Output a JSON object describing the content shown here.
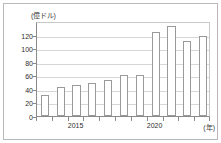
{
  "chart_data": {
    "type": "bar",
    "title": "",
    "subtitle": "",
    "unit_label": "(億ドル)",
    "xlabel": "(年)",
    "ylabel": "",
    "categories": [
      "2013",
      "2014",
      "2015",
      "2016",
      "2017",
      "2018",
      "2019",
      "2020",
      "2021",
      "2022",
      "2023"
    ],
    "values": [
      31,
      43,
      46,
      48,
      53,
      60,
      60,
      124,
      133,
      110,
      118
    ],
    "ylim": [
      0,
      140
    ],
    "yticks": [
      0,
      20,
      40,
      60,
      80,
      100,
      120
    ],
    "ytick_labels": [
      "0",
      "20",
      "40",
      "60",
      "80",
      "100",
      "120"
    ],
    "xtick_labels": [
      "2015",
      "2020"
    ],
    "xtick_label_positions": [
      2,
      7
    ],
    "grid": true,
    "legend": "none",
    "bar_fill": "#ffffff",
    "bar_edge": "#9a9a9a",
    "grid_color": "#d6d6d6",
    "axis_color": "#8a8a8a",
    "text_color": "#2e2e2e",
    "background": "#ffffff"
  }
}
